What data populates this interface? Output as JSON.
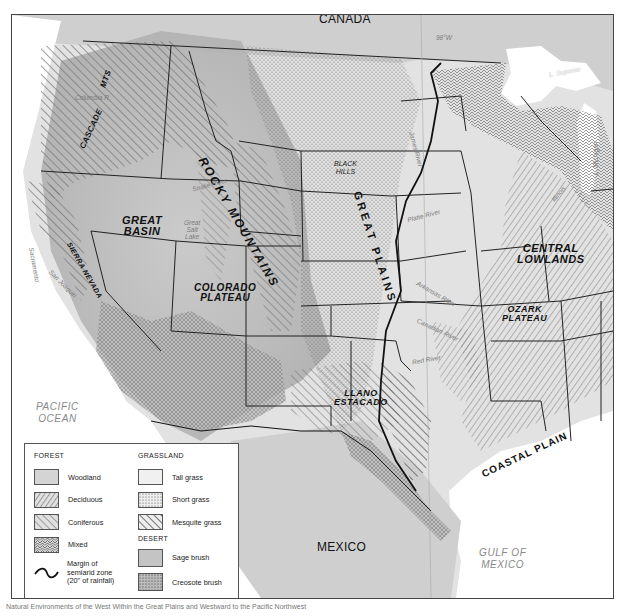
{
  "map": {
    "country_labels": {
      "canada": "CANADA",
      "mexico": "MEXICO"
    },
    "ocean_labels": {
      "pacific": "PACIFIC OCEAN",
      "pacific_line1": "PACIFIC",
      "pacific_line2": "OCEAN",
      "gulf_line1": "GULF OF",
      "gulf_line2": "MEXICO"
    },
    "meridian_label": "98°W",
    "regions": {
      "cascade": "CASCADE",
      "cascade_mts": "MTS",
      "rocky_mountains": "ROCKY MOUNTAINS",
      "great_basin_line1": "GREAT",
      "great_basin_line2": "BASIN",
      "sierra_nevada": "SIERRA NEVADA",
      "colorado_plateau_line1": "COLORADO",
      "colorado_plateau_line2": "PLATEAU",
      "great_plains": "GREAT PLAINS",
      "black_hills_line1": "BLACK",
      "black_hills_line2": "HILLS",
      "central_lowlands_line1": "CENTRAL",
      "central_lowlands_line2": "LOWLANDS",
      "ozark_plateau_line1": "OZARK",
      "ozark_plateau_line2": "PLATEAU",
      "llano_estacado_line1": "LLANO",
      "llano_estacado_line2": "ESTACADO",
      "coastal_plain": "COASTAL PLAIN"
    },
    "water_labels": {
      "columbia": "Columbia R.",
      "snake": "Snake River",
      "great_salt_lake_line1": "Great",
      "great_salt_lake_line2": "Salt",
      "great_salt_lake_line3": "Lake",
      "sacramento": "Sacramento",
      "san_joaquin": "San Joaquin",
      "platte": "Platte River",
      "arkansas": "Arkansas River",
      "canadian": "Canadian River",
      "red": "Red River",
      "james": "James River",
      "illinois": "Illinois",
      "lake_superior": "L. Superior",
      "lake_michigan": "L. Michigan"
    }
  },
  "legend": {
    "forest": {
      "heading": "FOREST",
      "items": [
        {
          "label": "Woodland",
          "pattern": "woodland"
        },
        {
          "label": "Deciduous",
          "pattern": "deciduous"
        },
        {
          "label": "Coniferous",
          "pattern": "coniferous"
        },
        {
          "label": "Mixed",
          "pattern": "mixed"
        }
      ],
      "margin_label_line1": "Margin of",
      "margin_label_line2": "semiarid zone",
      "margin_label_line3": "(20\" of rainfall)"
    },
    "grassland": {
      "heading": "GRASSLAND",
      "items": [
        {
          "label": "Tall grass",
          "pattern": "tallgrass"
        },
        {
          "label": "Short grass",
          "pattern": "shortgrass"
        },
        {
          "label": "Mesquite grass",
          "pattern": "mesquite"
        }
      ]
    },
    "desert": {
      "heading": "DESERT",
      "items": [
        {
          "label": "Sage brush",
          "pattern": "sage"
        },
        {
          "label": "Creosote brush",
          "pattern": "creosote"
        }
      ]
    }
  },
  "caption": "Natural Environments of the West Within the Great Plains and Westward to the Pacific Northwest",
  "colors": {
    "land": "#d9d9d9",
    "water": "#ffffff",
    "canada": "#cfcfcf",
    "border": "#222222",
    "hatch": "#6a6a6a"
  }
}
